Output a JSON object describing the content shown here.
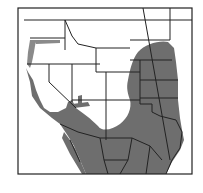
{
  "map": {
    "type": "species-range-map",
    "region": "Western North America",
    "colors": {
      "background": "#ffffff",
      "range_fill": "#6e6e6e",
      "range_light": "#8a8a8a",
      "border": "#222222"
    },
    "legend": []
  }
}
